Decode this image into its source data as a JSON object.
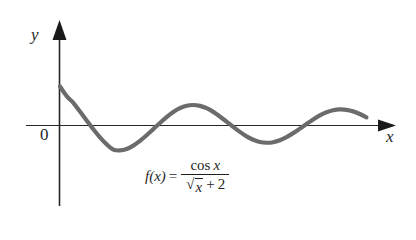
{
  "figure": {
    "kind": "line",
    "background_color": "#ffffff",
    "curve_color": "#6b6b6b",
    "axis_color": "#262626",
    "text_color": "#1f1f1f",
    "axes": {
      "x_label": "x",
      "y_label": "y",
      "origin_label": "0",
      "x_axis_has_arrow": true,
      "y_axis_has_arrow": true,
      "gridlines": false,
      "tick_labels": []
    },
    "formula": {
      "lhs": "f(x)",
      "equals": "=",
      "numerator": "cos x",
      "numerator_function": "cos",
      "numerator_variable": "x",
      "denominator_radical": "x",
      "denominator_plus": "+",
      "denominator_constant": "2",
      "plain_text": "f(x) = cos x / (√x + 2)"
    }
  },
  "chart_data": {
    "type": "line",
    "title": "",
    "subtitle": "",
    "xlabel": "x",
    "ylabel": "y",
    "annotations": [
      "f(x) = cos x / (√x + 2)"
    ],
    "legend": [],
    "legend_position": "none",
    "grid": false,
    "xlim": [
      0,
      14.5
    ],
    "ylim": [
      -0.45,
      0.55
    ],
    "axis_origin_label": "0",
    "series": [
      {
        "name": "f(x) = cos x / (sqrt(x) + 2)",
        "color": "#6b6b6b",
        "line_width_px": 4.2,
        "x": [
          0.0,
          0.3,
          0.6,
          0.9,
          1.2,
          1.5,
          1.8,
          2.1,
          2.4,
          2.7,
          3.0,
          3.3,
          3.6,
          3.9,
          4.2,
          4.5,
          4.8,
          5.1,
          5.4,
          5.7,
          6.0,
          6.3,
          6.6,
          6.9,
          7.2,
          7.5,
          7.8,
          8.1,
          8.4,
          8.7,
          9.0,
          9.3,
          9.6,
          9.9,
          10.2,
          10.5,
          10.8,
          11.1,
          11.4,
          11.7,
          12.0,
          12.3,
          12.6,
          12.9,
          13.2,
          13.5,
          13.8
        ],
        "y": [
          0.5,
          0.376,
          0.291,
          0.179,
          0.064,
          -0.049,
          -0.152,
          -0.241,
          -0.309,
          -0.32,
          -0.302,
          -0.258,
          -0.197,
          -0.125,
          -0.047,
          0.032,
          0.107,
          0.172,
          0.222,
          0.253,
          0.263,
          0.252,
          0.222,
          0.175,
          0.116,
          0.05,
          -0.018,
          -0.082,
          -0.139,
          -0.183,
          -0.211,
          -0.221,
          -0.214,
          -0.189,
          -0.149,
          -0.098,
          -0.04,
          0.02,
          0.078,
          0.129,
          0.169,
          0.195,
          0.206,
          0.201,
          0.181,
          0.148,
          0.105
        ],
        "key_points": {
          "start": {
            "x": 0.0,
            "y": 0.5
          },
          "troughs": [
            {
              "x": 2.9,
              "y": -0.322
            },
            {
              "x": 9.2,
              "y": -0.221
            },
            {
              "x": 12.6,
              "y": -0.206
            }
          ],
          "peaks": [
            {
              "x": 6.0,
              "y": 0.264
            },
            {
              "x": 9.6,
              "y": 0.208
            },
            {
              "x": 12.6,
              "y": 0.206
            }
          ],
          "end": {
            "x": 13.9,
            "y": 0.094
          }
        }
      }
    ]
  }
}
